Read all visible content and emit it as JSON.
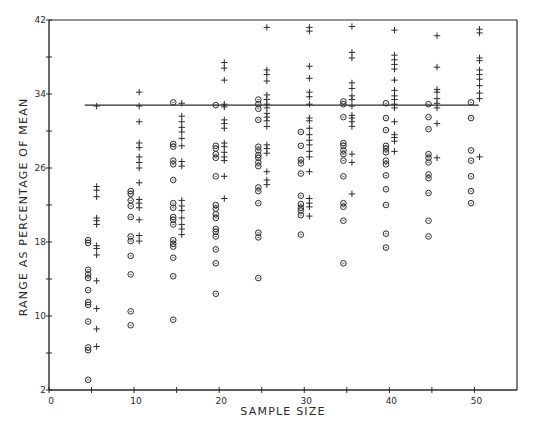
{
  "chart_data": {
    "type": "scatter",
    "title": "",
    "xlabel": "SAMPLE SIZE",
    "ylabel": "RANGE AS PERCENTAGE OF MEAN",
    "xlim": [
      0,
      55
    ],
    "ylim": [
      2,
      42
    ],
    "x_ticks": [
      0,
      5,
      10,
      15,
      20,
      25,
      30,
      35,
      40,
      45,
      50
    ],
    "x_tick_labels": [
      "0",
      "10",
      "20",
      "30",
      "40",
      "50"
    ],
    "y_ticks": [
      2,
      6,
      10,
      14,
      18,
      22,
      26,
      30,
      34,
      38,
      42
    ],
    "y_tick_labels": [
      "2",
      "10",
      "18",
      "26",
      "34",
      "42"
    ],
    "grid": false,
    "legend": null,
    "reference_line": {
      "y": 32.8,
      "x_start": 4.2,
      "x_end": 50.5
    },
    "categories": [
      5,
      10,
      15,
      20,
      25,
      30,
      35,
      40,
      45,
      50
    ],
    "series": [
      {
        "name": "circle",
        "marker": "circle",
        "x_offset": -0.4,
        "values": [
          [
            18.2,
            17.9,
            15.0,
            14.5,
            14.1,
            12.8,
            11.5,
            11.2,
            9.4,
            6.6,
            6.3,
            3.1
          ],
          [
            23.5,
            23.2,
            22.5,
            21.9,
            20.7,
            18.6,
            18.1,
            16.5,
            14.5,
            10.5,
            9.0
          ],
          [
            33.1,
            28.6,
            28.3,
            26.8,
            26.4,
            24.7,
            22.2,
            21.7,
            20.7,
            20.4,
            19.9,
            18.2,
            17.8,
            17.5,
            16.3,
            14.3,
            9.6
          ],
          [
            32.8,
            28.4,
            28.1,
            27.5,
            27.1,
            25.1,
            22.0,
            21.6,
            21.0,
            20.6,
            19.4,
            19.1,
            18.6,
            17.2,
            15.7,
            12.4
          ],
          [
            33.4,
            32.9,
            32.4,
            31.2,
            28.3,
            27.9,
            27.4,
            27.1,
            26.6,
            26.2,
            23.9,
            23.5,
            22.2,
            19.0,
            18.5,
            14.1
          ],
          [
            29.9,
            28.4,
            26.9,
            26.5,
            25.4,
            23.0,
            22.1,
            21.7,
            21.4,
            20.9,
            18.8
          ],
          [
            33.2,
            32.9,
            31.5,
            28.7,
            28.4,
            27.9,
            27.5,
            26.8,
            25.1,
            22.2,
            21.8,
            20.3,
            15.7
          ],
          [
            33.0,
            31.4,
            30.1,
            28.4,
            28.1,
            27.7,
            26.8,
            26.4,
            25.2,
            23.7,
            22.0,
            18.9,
            17.4
          ],
          [
            32.9,
            31.5,
            30.2,
            27.5,
            27.1,
            26.6,
            25.3,
            24.9,
            23.3,
            20.3,
            18.6
          ],
          [
            33.1,
            31.4,
            27.9,
            26.8,
            25.1,
            23.5,
            22.2
          ]
        ]
      },
      {
        "name": "plus",
        "marker": "plus",
        "x_offset": 0.6,
        "values": [
          [
            32.7,
            24.0,
            23.6,
            22.9,
            20.6,
            20.3,
            19.9,
            17.6,
            17.3,
            16.6,
            13.8,
            10.8,
            8.6,
            6.7
          ],
          [
            34.2,
            32.7,
            31.0,
            28.7,
            28.2,
            27.2,
            26.6,
            26.0,
            24.4,
            22.6,
            22.2,
            21.7,
            20.4,
            18.7,
            18.1
          ],
          [
            33.0,
            31.6,
            31.0,
            30.4,
            29.9,
            29.2,
            28.4,
            26.7,
            26.2,
            22.5,
            21.9,
            21.4,
            20.6,
            19.9,
            19.4,
            18.8
          ],
          [
            37.4,
            36.8,
            35.5,
            32.9,
            32.6,
            31.2,
            30.8,
            30.3,
            28.7,
            28.3,
            27.7,
            27.2,
            26.8,
            25.1,
            22.7
          ],
          [
            41.2,
            36.6,
            36.1,
            35.4,
            33.9,
            33.4,
            32.9,
            32.5,
            31.9,
            31.5,
            31.1,
            30.5,
            28.5,
            28.1,
            27.6,
            25.6,
            24.7,
            24.2
          ],
          [
            41.2,
            40.8,
            37.0,
            35.7,
            34.2,
            33.7,
            32.9,
            31.4,
            31.1,
            30.3,
            29.6,
            29.0,
            28.5,
            27.8,
            27.2,
            25.6,
            22.7,
            22.2,
            21.8,
            20.8
          ],
          [
            41.3,
            38.5,
            37.9,
            35.2,
            34.6,
            33.8,
            33.4,
            32.7,
            31.7,
            31.4,
            31.0,
            30.5,
            27.5,
            26.6,
            23.2
          ],
          [
            40.9,
            38.2,
            37.7,
            37.2,
            36.7,
            35.5,
            34.4,
            33.8,
            33.4,
            32.9,
            32.5,
            31.0,
            29.6,
            29.3,
            28.9,
            27.8
          ],
          [
            40.3,
            36.9,
            34.5,
            34.2,
            33.5,
            33.0,
            32.5,
            30.8,
            27.1
          ],
          [
            41.0,
            40.6,
            37.9,
            37.6,
            36.6,
            36.1,
            35.6,
            34.9,
            34.1,
            33.5,
            27.2
          ]
        ]
      }
    ]
  }
}
